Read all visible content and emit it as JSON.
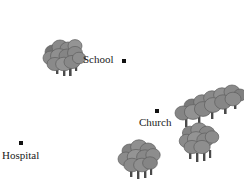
{
  "map": {
    "background_color": "#ffffff",
    "width": 244,
    "height": 184,
    "tree_canopy_color": "#8a8a8a",
    "tree_canopy_shade_color": "#737373",
    "tree_canopy_highlight_color": "#9c9c9c",
    "tree_outline_color": "#5e5e5e",
    "tree_trunk_color": "#4a4a4a",
    "marker_color": "#111111",
    "label_color": "#1a1a1a",
    "places": [
      {
        "name": "School",
        "label": "School",
        "label_x": 83,
        "label_y": 54,
        "dot_x": 122,
        "dot_y": 59
      },
      {
        "name": "Church",
        "label": "Church",
        "label_x": 139,
        "label_y": 117,
        "dot_x": 155,
        "dot_y": 109
      },
      {
        "name": "Hospital",
        "label": "Hospital",
        "label_x": 2,
        "label_y": 150,
        "dot_x": 19,
        "dot_y": 141
      }
    ],
    "forests": [
      {
        "name": "forest-northwest",
        "x": 40,
        "y": 36,
        "scale": 1.0,
        "rotation": 0,
        "tree_count": 6
      },
      {
        "name": "forest-east-ridge",
        "x": 172,
        "y": 86,
        "scale": 1.0,
        "rotation": 0,
        "tree_count": 7
      },
      {
        "name": "forest-southeast",
        "x": 178,
        "y": 122,
        "scale": 1.0,
        "rotation": 0,
        "tree_count": 4
      },
      {
        "name": "forest-south",
        "x": 116,
        "y": 136,
        "scale": 1.0,
        "rotation": 0,
        "tree_count": 5
      }
    ]
  }
}
